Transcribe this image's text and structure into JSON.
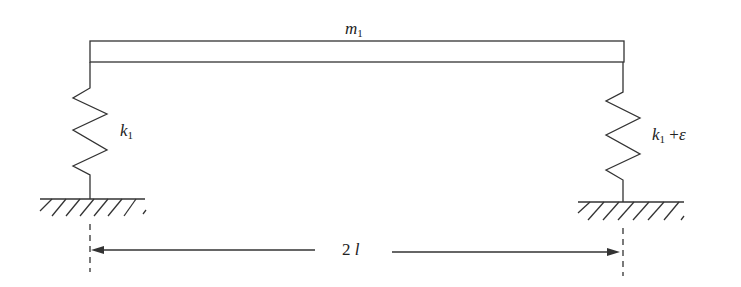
{
  "diagram": {
    "type": "mechanical system: rigid beam on two springs",
    "mass_label": {
      "symbol": "m",
      "subscript": "1"
    },
    "left_spring_label": {
      "symbol": "k",
      "subscript": "1"
    },
    "right_spring_label": {
      "symbol": "k",
      "subscript": "1",
      "suffix": "+",
      "extra": "ε"
    },
    "span_label": {
      "number": "2",
      "symbol": "l"
    },
    "colors": {
      "line": "#333333",
      "background": "#ffffff"
    }
  }
}
